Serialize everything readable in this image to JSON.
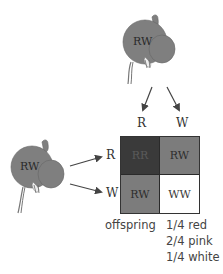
{
  "parents": {
    "top": {
      "genotype": "RW"
    },
    "left": {
      "genotype": "RW"
    }
  },
  "gametes": {
    "top": [
      "R",
      "W"
    ],
    "left": [
      "R",
      "W"
    ]
  },
  "punnett": {
    "cells": [
      {
        "genotype": "RR",
        "color": "#3a3a3a",
        "text_color": "#555555"
      },
      {
        "genotype": "RW",
        "color": "#7c7c7c",
        "text_color": "#2e2e2e"
      },
      {
        "genotype": "RW",
        "color": "#7c7c7c",
        "text_color": "#2e2e2e"
      },
      {
        "genotype": "WW",
        "color": "#ffffff",
        "text_color": "#3a3a3a"
      }
    ]
  },
  "offspring": {
    "label": "offspring",
    "ratios": [
      "1/4 red",
      "2/4 pink",
      "1/4 white"
    ]
  },
  "colors": {
    "flower_fill": "#7f7f7f",
    "flower_outline": "#555555",
    "grid_border": "#333333"
  }
}
